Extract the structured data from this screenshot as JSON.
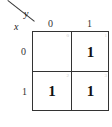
{
  "kmap": {
    "row_var": "x",
    "col_var": "y",
    "col_labels": [
      "0",
      "1"
    ],
    "row_labels": [
      "0",
      "1"
    ],
    "cells": [
      {
        "index": "0",
        "value": ""
      },
      {
        "index": "1",
        "value": "1"
      },
      {
        "index": "2",
        "value": "1"
      },
      {
        "index": "3",
        "value": "1"
      }
    ]
  }
}
